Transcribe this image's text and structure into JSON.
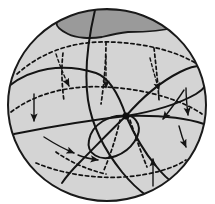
{
  "figure": {
    "type": "mathematical-diagram",
    "canvas": {
      "width": 215,
      "height": 204
    },
    "background_color": "#ffffff"
  },
  "sphere": {
    "label": "sphere-body",
    "center_x": 107,
    "center_y": 105,
    "radius_x": 99,
    "radius_y": 96,
    "fill_color": "#d4d4d4",
    "outline_color": "#1a1a1a",
    "outline_width": 2.0
  },
  "cap": {
    "label": "shaded-polar-cap",
    "fill_color": "#9a9a9a",
    "outline_color": "#1a1a1a",
    "outline_width": 1.8,
    "path": "M 57,22 C 64,13 78,9 96,9 C 122,9 150,11 168,16 C 176,18 178,22 175,27 C 166,30 146,32 128,32 C 118,33 110,35 102,37 C 90,39 76,38 68,34 C 60,30 55,26 57,22 Z"
  },
  "singular_point": {
    "label": "degenerate-equilibrium",
    "x": 126,
    "y": 116,
    "radius": 3.6,
    "color": "#0d0d0d"
  },
  "dashed_curves": [
    {
      "name": "upper-latitude-dashed",
      "path": "M 17,74 C 45,49 78,41 110,42 C 146,43 180,52 200,66",
      "dash": "3.4,3.0"
    },
    {
      "name": "middle-latitude-dashed",
      "path": "M 11,112 C 36,93 70,85 106,87 C 146,89 182,100 202,114",
      "dash": "3.4,3.0"
    },
    {
      "name": "lower-latitude-dashed",
      "path": "M 36,163 C 60,173 92,179 124,177 C 152,175 174,168 186,160",
      "dash": "3.4,3.0"
    },
    {
      "name": "meridian-dashed-left",
      "path": "M 63,53 C 61,70 62,86 64,101",
      "dash": "3.2,2.9"
    },
    {
      "name": "meridian-dashed-center",
      "path": "M 106,42 C 106,62 104,84 101,104",
      "dash": "3.2,2.9"
    },
    {
      "name": "meridian-dashed-right",
      "path": "M 154,48 C 156,66 158,84 159,100",
      "dash": "3.2,2.9"
    },
    {
      "name": "meridian-dashed-lower-center",
      "path": "M 120,120 C 116,138 110,156 104,170",
      "dash": "3.2,2.9"
    },
    {
      "name": "meridian-dashed-lower-right",
      "path": "M 130,120 C 136,138 142,155 147,167",
      "dash": "3.2,2.9"
    },
    {
      "name": "bottom-meridian-dashed-left",
      "path": "M 56,152 C 70,162 88,170 106,174",
      "dash": "3.2,2.9"
    }
  ],
  "solid_curves": [
    {
      "name": "separatrix-upper-left-arc",
      "path": "M 9,86 C 30,69 62,62 96,73 C 110,78 120,98 126,116"
    },
    {
      "name": "separatrix-upper-right-arc",
      "path": "M 126,116 C 140,100 158,83 180,72 C 190,67 198,65 204,66"
    },
    {
      "name": "separatrix-right-sweep",
      "path": "M 126,116 C 150,112 175,106 196,94 C 201,91 204,88 206,85"
    },
    {
      "name": "separatrix-left-horizontal",
      "path": "M 14,134 C 44,128 82,121 126,116"
    },
    {
      "name": "separatrix-right-horizontal",
      "path": "M 126,116 C 158,115 186,118 204,124"
    },
    {
      "name": "separatrix-lower-left-long",
      "path": "M 126,116 C 112,129 96,146 80,162 C 72,170 66,177 62,183"
    },
    {
      "name": "separatrix-lower-right-long",
      "path": "M 126,116 C 134,134 144,152 156,166 C 163,175 170,181 176,185"
    },
    {
      "name": "homoclinic-loop",
      "path": "M 126,116 C 110,114 92,124 89,140 C 86,154 100,162 116,156 C 132,150 142,134 138,124 C 135,117 130,115 126,116 Z"
    },
    {
      "name": "meridian-solid-through-pole",
      "path": "M 95,10 C 88,40 84,72 88,100 C 92,126 106,152 122,172 C 131,183 140,191 147,196"
    }
  ],
  "flow_arrows": [
    {
      "name": "arrow-inflow-upper-left",
      "path": "M 56,54 C 60,66 64,76 69,86",
      "style": "dashed"
    },
    {
      "name": "arrow-inflow-upper-mid",
      "path": "M 106,56 C 106,68 106,78 106,88",
      "style": "dashed"
    },
    {
      "name": "arrow-inflow-upper-right",
      "path": "M 150,58 C 153,70 156,80 159,90",
      "style": "dashed"
    },
    {
      "name": "arrow-down-left-edge",
      "path": "M 34,94 C 34,104 34,112 34,121",
      "style": "solid"
    },
    {
      "name": "arrow-down-right-edge",
      "path": "M 186,88 C 186,98 187,106 188,115",
      "style": "solid"
    },
    {
      "name": "arrow-inflow-right-inner",
      "path": "M 184,90 C 177,101 170,110 163,119",
      "style": "solid"
    },
    {
      "name": "arrow-down-right-lower",
      "path": "M 179,126 C 181,134 183,140 186,147",
      "style": "solid"
    },
    {
      "name": "arrow-curve-lower-left",
      "path": "M 44,137 C 55,144 64,149 74,153",
      "style": "solid"
    },
    {
      "name": "arrow-loop-bottom",
      "path": "M 78,155 C 85,158 91,159 98,160",
      "style": "solid"
    },
    {
      "name": "arrow-up-bottom-right",
      "path": "M 153,186 C 153,176 153,168 153,159",
      "style": "solid"
    }
  ],
  "style": {
    "stroke_color": "#141414",
    "dash_color": "#121212",
    "stroke_width_solid": 2.0,
    "stroke_width_dashed": 1.7,
    "arrow_width": 1.4
  }
}
